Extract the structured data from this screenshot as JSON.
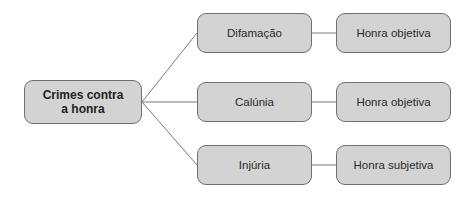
{
  "diagram": {
    "root": {
      "label": "Crimes contra a honra",
      "line1": "Crimes contra",
      "line2": "a honra"
    },
    "branches": [
      {
        "crime": "Difamação",
        "object": "Honra objetiva"
      },
      {
        "crime": "Calúnia",
        "object": "Honra objetiva"
      },
      {
        "crime": "Injúria",
        "object": "Honra subjetiva"
      }
    ],
    "colors": {
      "box_fill": "#d3d3d3",
      "box_border": "#6f6f6f",
      "line": "#7a7a7a",
      "text": "#2a2a2a"
    }
  }
}
